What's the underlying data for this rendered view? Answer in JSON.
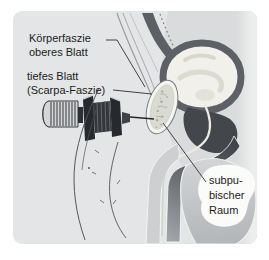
{
  "figure": {
    "type": "medical-anatomy-illustration",
    "labels": {
      "koerperfaszie": "Körperfaszie\noberes Blatt",
      "tiefes_blatt": "tiefes Blatt\n(Scarpa-Faszie)",
      "subpubischer_raum": "subpu-\nbischer\nRaum"
    },
    "colors": {
      "panel_bg": "#e3e5e6",
      "body_tissue": "#d9dbdc",
      "fascia_dark": "#5c6065",
      "bladder_wall": "#5d6165",
      "bladder_lumen": "#f1f0ea",
      "prostate_dark": "#43474b",
      "bone_fill": "#d9dad1",
      "scrotum": "#c3c6c8",
      "callout_bg": "#fbfbfa",
      "leader_line": "#3f4347",
      "text": "#1c1c1c"
    }
  }
}
